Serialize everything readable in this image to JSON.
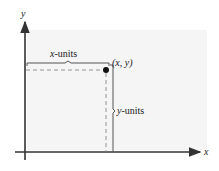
{
  "diagram": {
    "axes": {
      "x_label": "x",
      "y_label": "y"
    },
    "point": {
      "label": "(x, y)"
    },
    "brace_horizontal": {
      "var": "x",
      "suffix": "-units"
    },
    "brace_vertical": {
      "var": "y",
      "suffix": "-units"
    },
    "colors": {
      "axis": "#333333",
      "dashed": "#888888",
      "brace": "#555555",
      "background_panel": "#f4f4f4"
    }
  }
}
